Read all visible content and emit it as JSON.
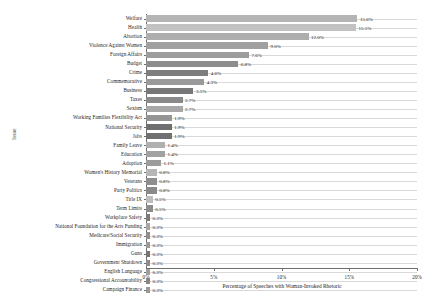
{
  "top_caption": "",
  "chart_data": {
    "type": "bar",
    "orientation": "horizontal",
    "title": "",
    "xlabel": "Percentage of Speeches with Woman-Invoked Rhetoric",
    "ylabel": "Issue",
    "xlim": [
      0,
      20
    ],
    "grid": true,
    "legend": "none",
    "xticks": [
      "0%",
      "5%",
      "10%",
      "15%",
      "20%"
    ],
    "xtick_values": [
      0,
      5,
      10,
      15,
      20
    ],
    "categories": [
      "Welfare",
      "Health",
      "Abortion",
      "Violence Against Women",
      "Foreign Affairs",
      "Budget",
      "Crime",
      "Commemorative",
      "Business",
      "Taxes",
      "Sexism",
      "Working Families Flexibility Act",
      "National Security",
      "Jobs",
      "Family Leave",
      "Education",
      "Adoption",
      "Women's History Memorial",
      "Veterans",
      "Party Politics",
      "Title IX",
      "Term Limits",
      "Workplace Safety",
      "National Foundation for the Arts Funding",
      "Medicare/Social Security",
      "Immigration",
      "Guns",
      "Government Shutdown",
      "English Language",
      "Congressional Accountability",
      "Campaign Finance"
    ],
    "values": [
      15.6,
      15.5,
      12.0,
      9.0,
      7.6,
      6.8,
      4.6,
      4.3,
      3.5,
      2.7,
      2.7,
      1.9,
      1.9,
      1.9,
      1.4,
      1.4,
      1.1,
      0.8,
      0.8,
      0.8,
      0.5,
      0.5,
      0.3,
      0.3,
      0.3,
      0.3,
      0.3,
      0.3,
      0.3,
      0.3,
      0.3
    ],
    "value_labels": [
      "15.6%",
      "15.5%",
      "12.0%",
      "9.0%",
      "7.6%",
      "6.8%",
      "4.6%",
      "4.3%",
      "3.5%",
      "2.7%",
      "2.7%",
      "1.9%",
      "1.9%",
      "1.9%",
      "1.4%",
      "1.4%",
      "1.1%",
      "0.8%",
      "0.8%",
      "0.8%",
      "0.5%",
      "0.5%",
      "0.3%",
      "0.3%",
      "0.3%",
      "0.3%",
      "0.3%",
      "0.3%",
      "0.3%",
      "0.3%",
      "0.3%"
    ],
    "bar_colors": [
      "#b4b4b4",
      "#c2c2c2",
      "#aeaeae",
      "#a0a0a0",
      "#9d9d9d",
      "#8d8d8d",
      "#7e7e7e",
      "#9a9a9a",
      "#787878",
      "#8a8a8a",
      "#a8a8a8",
      "#959595",
      "#6f6f6f",
      "#707070",
      "#b0b0b0",
      "#a2a2a2",
      "#9c9c9c",
      "#b6b6b6",
      "#8e8e8e",
      "#8a8a8a",
      "#bdbdbd",
      "#8c8c8c",
      "#7a7a7a",
      "#a6a6a6",
      "#8f8f8f",
      "#9b9b9b",
      "#747474",
      "#8b8b8b",
      "#9f9f9f",
      "#868686",
      "#999999"
    ]
  }
}
